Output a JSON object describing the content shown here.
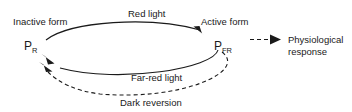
{
  "diagram": {
    "background_color": "#ffffff",
    "line_color": "#1a1a1a",
    "nodes": [
      {
        "id": "pr",
        "base": "P",
        "subscript": "R",
        "caption": "Inactive form",
        "x": 30,
        "y": 46
      },
      {
        "id": "pfr",
        "base": "P",
        "subscript": "FR",
        "caption": "Active form",
        "x": 212,
        "y": 46
      }
    ],
    "edges": [
      {
        "id": "red-light",
        "label": "Red light",
        "from": "pr",
        "to": "pfr",
        "style": "solid",
        "direction": "forward"
      },
      {
        "id": "far-red-light",
        "label": "Far-red light",
        "from": "pfr",
        "to": "pr",
        "style": "solid",
        "direction": "reverse"
      },
      {
        "id": "dark-reversion",
        "label": "Dark reversion",
        "from": "pfr",
        "to": "pr",
        "style": "dashed",
        "direction": "reverse"
      },
      {
        "id": "physiological-response",
        "label": "",
        "from": "pfr",
        "to": "response",
        "style": "dashed",
        "direction": "forward"
      }
    ],
    "outcome": {
      "id": "response",
      "line1": "Physiological",
      "line2": "response"
    }
  }
}
